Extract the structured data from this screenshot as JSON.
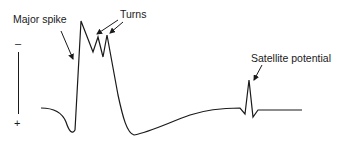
{
  "diagram": {
    "labels": {
      "major_spike": "Major spike",
      "turns": "Turns",
      "satellite": "Satellite potential"
    },
    "polarity": {
      "negative": "–",
      "positive": "+"
    },
    "colors": {
      "trace": "#1a1a1a",
      "background": "#ffffff"
    }
  }
}
